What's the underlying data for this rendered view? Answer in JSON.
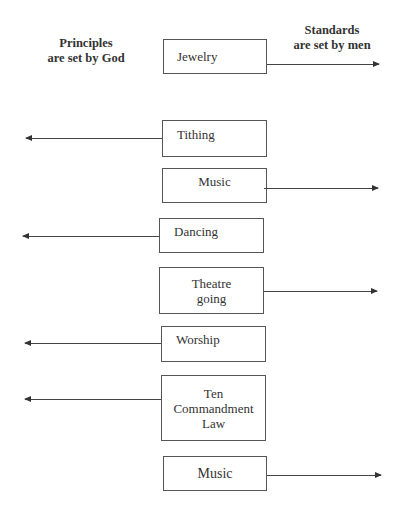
{
  "headers": {
    "left": {
      "line1": "Principles",
      "line2": "are set by God"
    },
    "right": {
      "line1": "Standards",
      "line2": "are set by men"
    }
  },
  "items": [
    {
      "label": "Jewelry",
      "direction": "right"
    },
    {
      "label": "Tithing",
      "direction": "left"
    },
    {
      "label": "Music",
      "direction": "right"
    },
    {
      "label": "Dancing",
      "direction": "left"
    },
    {
      "label_lines": [
        "Theatre",
        "going"
      ],
      "direction": "right"
    },
    {
      "label": "Worship",
      "direction": "left"
    },
    {
      "label_lines": [
        "Ten",
        "Commandment",
        "Law"
      ],
      "direction": "left"
    },
    {
      "label": "Music",
      "direction": "right"
    }
  ]
}
